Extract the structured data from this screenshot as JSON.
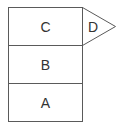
{
  "diagram": {
    "type": "stacked-blocks-with-pointer",
    "stroke_color": "#5a5a5a",
    "text_color": "#333333",
    "background": "#ffffff",
    "blocks": [
      {
        "label": "C",
        "position": "top"
      },
      {
        "label": "B",
        "position": "middle"
      },
      {
        "label": "A",
        "position": "bottom"
      }
    ],
    "pointer": {
      "label": "D",
      "attached_to": "C",
      "direction": "right"
    }
  }
}
